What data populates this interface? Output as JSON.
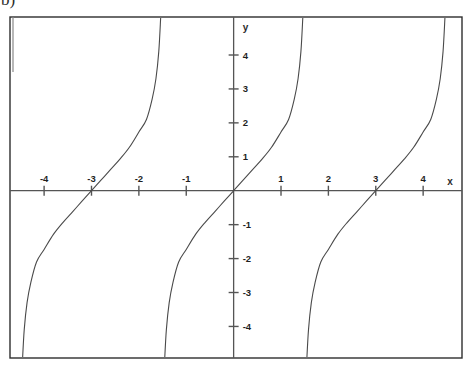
{
  "figure": {
    "corner_label": "b)",
    "background_color": "#ffffff",
    "frame_color": "#2e2e2e",
    "axis_color": "#555555",
    "curve_color": "#4a4a4a"
  },
  "chart_data": {
    "type": "line",
    "title": "",
    "subtitle": "",
    "xlabel": "x",
    "ylabel": "y",
    "function": "y = tan(pi*x/3)",
    "period": 3,
    "xlim": [
      -4.72,
      4.82
    ],
    "ylim": [
      -4.93,
      5.12
    ],
    "grid": false,
    "legend": null,
    "x_ticks": [
      -4,
      -3,
      -2,
      -1,
      1,
      2,
      3,
      4
    ],
    "x_tick_labels": [
      "-4",
      "-3",
      "-2",
      "-1",
      "1",
      "2",
      "3",
      "4"
    ],
    "y_ticks": [
      4,
      3,
      2,
      1,
      -1,
      -2,
      -3,
      -4
    ],
    "y_tick_labels": [
      "4",
      "3",
      "2",
      "1",
      "-1",
      "-2",
      "-3",
      "-4"
    ],
    "zeros": [
      -3,
      0,
      3
    ],
    "asymptotes": [
      -4.5,
      -1.5,
      1.5,
      4.5
    ],
    "branches": [
      {
        "name": "branch-left",
        "x_range": [
          -4.5,
          -1.5
        ],
        "points": [
          {
            "x": -4.46,
            "y": -5.1
          },
          {
            "x": -4.42,
            "y": -4.1
          },
          {
            "x": -4.36,
            "y": -3.3
          },
          {
            "x": -4.28,
            "y": -2.7
          },
          {
            "x": -4.16,
            "y": -2.1
          },
          {
            "x": -4.0,
            "y": -1.73
          },
          {
            "x": -3.8,
            "y": -1.28
          },
          {
            "x": -3.6,
            "y": -0.93
          },
          {
            "x": -3.4,
            "y": -0.62
          },
          {
            "x": -3.2,
            "y": -0.31
          },
          {
            "x": -3.0,
            "y": 0.0
          },
          {
            "x": -2.8,
            "y": 0.31
          },
          {
            "x": -2.6,
            "y": 0.62
          },
          {
            "x": -2.4,
            "y": 0.93
          },
          {
            "x": -2.2,
            "y": 1.28
          },
          {
            "x": -2.0,
            "y": 1.73
          },
          {
            "x": -1.84,
            "y": 2.1
          },
          {
            "x": -1.72,
            "y": 2.7
          },
          {
            "x": -1.64,
            "y": 3.3
          },
          {
            "x": -1.58,
            "y": 4.1
          },
          {
            "x": -1.54,
            "y": 5.1
          }
        ]
      },
      {
        "name": "branch-center",
        "x_range": [
          -1.5,
          1.5
        ],
        "points": [
          {
            "x": -1.46,
            "y": -5.1
          },
          {
            "x": -1.42,
            "y": -4.1
          },
          {
            "x": -1.36,
            "y": -3.3
          },
          {
            "x": -1.28,
            "y": -2.7
          },
          {
            "x": -1.16,
            "y": -2.1
          },
          {
            "x": -1.0,
            "y": -1.73
          },
          {
            "x": -0.8,
            "y": -1.28
          },
          {
            "x": -0.6,
            "y": -0.93
          },
          {
            "x": -0.4,
            "y": -0.62
          },
          {
            "x": -0.2,
            "y": -0.31
          },
          {
            "x": 0.0,
            "y": 0.0
          },
          {
            "x": 0.2,
            "y": 0.31
          },
          {
            "x": 0.4,
            "y": 0.62
          },
          {
            "x": 0.6,
            "y": 0.93
          },
          {
            "x": 0.8,
            "y": 1.28
          },
          {
            "x": 1.0,
            "y": 1.73
          },
          {
            "x": 1.16,
            "y": 2.1
          },
          {
            "x": 1.28,
            "y": 2.7
          },
          {
            "x": 1.36,
            "y": 3.3
          },
          {
            "x": 1.42,
            "y": 4.1
          },
          {
            "x": 1.46,
            "y": 5.1
          }
        ]
      },
      {
        "name": "branch-right",
        "x_range": [
          1.5,
          4.5
        ],
        "points": [
          {
            "x": 1.54,
            "y": -5.1
          },
          {
            "x": 1.58,
            "y": -4.1
          },
          {
            "x": 1.64,
            "y": -3.3
          },
          {
            "x": 1.72,
            "y": -2.7
          },
          {
            "x": 1.84,
            "y": -2.1
          },
          {
            "x": 2.0,
            "y": -1.73
          },
          {
            "x": 2.2,
            "y": -1.28
          },
          {
            "x": 2.4,
            "y": -0.93
          },
          {
            "x": 2.6,
            "y": -0.62
          },
          {
            "x": 2.8,
            "y": -0.31
          },
          {
            "x": 3.0,
            "y": 0.0
          },
          {
            "x": 3.2,
            "y": 0.31
          },
          {
            "x": 3.4,
            "y": 0.62
          },
          {
            "x": 3.6,
            "y": 0.93
          },
          {
            "x": 3.8,
            "y": 1.28
          },
          {
            "x": 4.0,
            "y": 1.73
          },
          {
            "x": 4.16,
            "y": 2.1
          },
          {
            "x": 4.28,
            "y": 2.7
          },
          {
            "x": 4.36,
            "y": 3.3
          },
          {
            "x": 4.42,
            "y": 4.1
          },
          {
            "x": 4.46,
            "y": 5.1
          }
        ]
      }
    ]
  }
}
